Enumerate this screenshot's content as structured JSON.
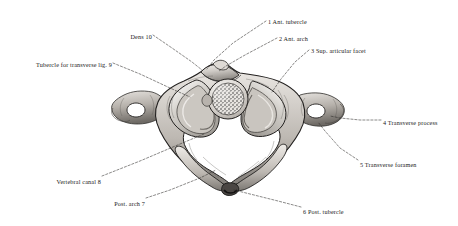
{
  "figure": {
    "style": "engraved anatomical plate, grayscale stipple and line shading",
    "background_color": "#ffffff",
    "ink_color": "#1a1a1a",
    "leader_line_style": "dashed"
  },
  "labels": [
    {
      "id": "1",
      "text": "1 Ant. tubercle",
      "x": 268,
      "y": 19,
      "align": "left",
      "leader": [
        [
          266,
          21
        ],
        [
          233,
          43
        ],
        [
          214,
          60
        ],
        [
          207,
          69
        ]
      ]
    },
    {
      "id": "2",
      "text": "2 Ant. arch",
      "x": 279,
      "y": 36,
      "align": "left",
      "leader": [
        [
          277,
          38
        ],
        [
          245,
          55
        ],
        [
          226,
          66
        ],
        [
          219,
          71
        ]
      ]
    },
    {
      "id": "3",
      "text": "3 Sup. articular facet",
      "x": 311,
      "y": 48,
      "align": "left",
      "leader": [
        [
          309,
          50
        ],
        [
          295,
          62
        ],
        [
          281,
          79
        ],
        [
          272,
          92
        ]
      ]
    },
    {
      "id": "4",
      "text": "4 Transverse process",
      "x": 383,
      "y": 120,
      "align": "left",
      "leader": [
        [
          381,
          120
        ],
        [
          360,
          120
        ],
        [
          340,
          118
        ],
        [
          330,
          116
        ]
      ]
    },
    {
      "id": "5",
      "text": "5 Transverse foramen",
      "x": 360,
      "y": 162,
      "align": "left",
      "leader": [
        [
          358,
          160
        ],
        [
          340,
          148
        ],
        [
          325,
          131
        ],
        [
          318,
          122
        ]
      ]
    },
    {
      "id": "6",
      "text": "6 Post. tubercle",
      "x": 303,
      "y": 209,
      "align": "left",
      "leader": [
        [
          301,
          207
        ],
        [
          278,
          201
        ],
        [
          250,
          194
        ],
        [
          234,
          190
        ]
      ]
    },
    {
      "id": "7",
      "text": "Post. arch 7",
      "x": 145,
      "y": 201,
      "align": "right",
      "leader": [
        [
          146,
          198
        ],
        [
          170,
          190
        ],
        [
          200,
          178
        ],
        [
          216,
          170
        ]
      ]
    },
    {
      "id": "8",
      "text": "Vertebral canal 8",
      "x": 101,
      "y": 179,
      "align": "right",
      "leader": [
        [
          102,
          176
        ],
        [
          140,
          161
        ],
        [
          180,
          144
        ],
        [
          204,
          134
        ]
      ]
    },
    {
      "id": "9",
      "text": "Tubercle for transverse lig. 9",
      "x": 112,
      "y": 62,
      "align": "right",
      "leader": [
        [
          113,
          63
        ],
        [
          140,
          74
        ],
        [
          170,
          88
        ],
        [
          190,
          97
        ]
      ]
    },
    {
      "id": "10",
      "text": "Dens 10",
      "x": 152,
      "y": 34,
      "align": "right",
      "leader": [
        [
          153,
          35
        ],
        [
          172,
          48
        ],
        [
          192,
          62
        ],
        [
          202,
          70
        ]
      ]
    }
  ],
  "structures": [
    {
      "name": "anterior-tubercle",
      "label_ref": "1"
    },
    {
      "name": "anterior-arch",
      "label_ref": "2"
    },
    {
      "name": "superior-articular-facet",
      "label_ref": "3"
    },
    {
      "name": "transverse-process",
      "label_ref": "4"
    },
    {
      "name": "transverse-foramen",
      "label_ref": "5"
    },
    {
      "name": "posterior-tubercle",
      "label_ref": "6"
    },
    {
      "name": "posterior-arch",
      "label_ref": "7"
    },
    {
      "name": "vertebral-canal",
      "label_ref": "8"
    },
    {
      "name": "tubercle-for-transverse-ligament",
      "label_ref": "9"
    },
    {
      "name": "dens",
      "label_ref": "10"
    }
  ]
}
